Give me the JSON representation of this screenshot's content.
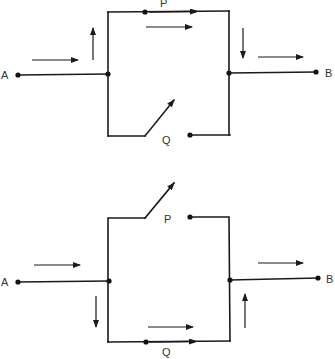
{
  "diagrams": [
    {
      "id": "top",
      "description": "Parallel circuit: switch P closed, switch Q open; current flows through P",
      "labels": {
        "a": "A",
        "b": "B",
        "p": "P",
        "q": "Q"
      },
      "switch_p": "closed",
      "switch_q": "open"
    },
    {
      "id": "bottom",
      "description": "Parallel circuit: switch P open, switch Q closed; current flows through Q",
      "labels": {
        "a": "A",
        "b": "B",
        "p": "P",
        "q": "Q"
      },
      "switch_p": "open",
      "switch_q": "closed"
    }
  ],
  "colors": {
    "line": "#1a1a1a",
    "label": "#333333",
    "background": "#ffffff"
  }
}
